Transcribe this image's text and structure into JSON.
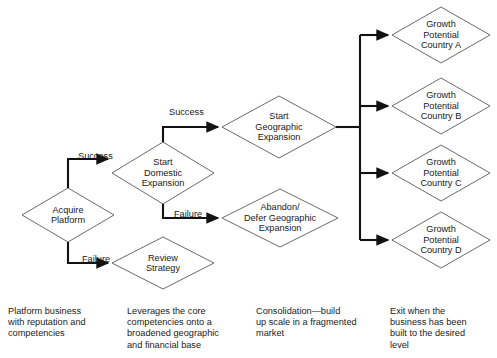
{
  "diagram": {
    "style": {
      "shape_stroke": "#595959",
      "connector_stroke": "#121212",
      "text_color": "#1a1a1a",
      "background": "#ffffff"
    },
    "nodes": [
      {
        "id": "acquire-platform",
        "label": "Acquire\nPlatform",
        "shape": "diamond",
        "cx": 68,
        "cy": 215,
        "rx": 46,
        "ry": 27
      },
      {
        "id": "start-domestic-expansion",
        "label": "Start\nDomestic\nExpansion",
        "shape": "diamond",
        "cx": 163,
        "cy": 173,
        "rx": 51,
        "ry": 31
      },
      {
        "id": "review-strategy",
        "label": "Review\nStrategy",
        "shape": "diamond",
        "cx": 163,
        "cy": 263,
        "rx": 51,
        "ry": 26
      },
      {
        "id": "start-geographic-expansion",
        "label": "Start\nGeographic\nExpansion",
        "shape": "diamond",
        "cx": 279,
        "cy": 127,
        "rx": 57,
        "ry": 31
      },
      {
        "id": "abandon-defer-geographic-expansion",
        "label": "Abandon/\nDefer Geographic\nExpansion",
        "shape": "diamond",
        "cx": 280,
        "cy": 218,
        "rx": 58,
        "ry": 29
      },
      {
        "id": "growth-potential-country-a",
        "label": "Growth\nPotential\nCountry A",
        "shape": "diamond",
        "cx": 441,
        "cy": 35,
        "rx": 49,
        "ry": 28
      },
      {
        "id": "growth-potential-country-b",
        "label": "Growth\nPotential\nCountry B",
        "shape": "diamond",
        "cx": 441,
        "cy": 106,
        "rx": 49,
        "ry": 28
      },
      {
        "id": "growth-potential-country-c",
        "label": "Growth\nPotential\nCountry C",
        "shape": "diamond",
        "cx": 441,
        "cy": 173,
        "rx": 49,
        "ry": 28
      },
      {
        "id": "growth-potential-country-d",
        "label": "Growth\nPotential\nCountry D",
        "shape": "diamond",
        "cx": 441,
        "cy": 240,
        "rx": 49,
        "ry": 28
      }
    ],
    "edge_labels": [
      {
        "id": "success-domestic",
        "text": "Success",
        "x": 78,
        "y": 162
      },
      {
        "id": "failure-review",
        "text": "Failure",
        "x": 82,
        "y": 265
      },
      {
        "id": "success-geographic",
        "text": "Success",
        "x": 169,
        "y": 118
      },
      {
        "id": "failure-abandon",
        "text": "Failure",
        "x": 174,
        "y": 220
      }
    ],
    "edges": [
      {
        "id": "acquire-to-domestic",
        "from": "acquire-platform",
        "to": "start-domestic-expansion",
        "label": "Success"
      },
      {
        "id": "acquire-to-review",
        "from": "acquire-platform",
        "to": "review-strategy",
        "label": "Failure"
      },
      {
        "id": "domestic-to-geographic",
        "from": "start-domestic-expansion",
        "to": "start-geographic-expansion",
        "label": "Success"
      },
      {
        "id": "domestic-to-abandon",
        "from": "start-domestic-expansion",
        "to": "abandon-defer-geographic-expansion",
        "label": "Failure"
      },
      {
        "id": "geographic-to-country-a",
        "from": "start-geographic-expansion",
        "to": "growth-potential-country-a",
        "label": ""
      },
      {
        "id": "geographic-to-country-b",
        "from": "start-geographic-expansion",
        "to": "growth-potential-country-b",
        "label": ""
      },
      {
        "id": "geographic-to-country-c",
        "from": "start-geographic-expansion",
        "to": "growth-potential-country-c",
        "label": ""
      },
      {
        "id": "geographic-to-country-d",
        "from": "start-geographic-expansion",
        "to": "growth-potential-country-d",
        "label": ""
      }
    ]
  },
  "captions": [
    {
      "id": "caption-1",
      "text": "Platform business\nwith reputation and\ncompetencies",
      "x": 8,
      "y": 306
    },
    {
      "id": "caption-2",
      "text": "Leverages the core\ncompetencies onto a\nbroadened geographic\nand financial base",
      "x": 127,
      "y": 306
    },
    {
      "id": "caption-3",
      "text": "Consolidation—build\nup scale in a fragmented\nmarket",
      "x": 256,
      "y": 306
    },
    {
      "id": "caption-4",
      "text": "Exit when the\nbusiness has been\nbuilt to the desired\nlevel",
      "x": 390,
      "y": 306
    }
  ]
}
